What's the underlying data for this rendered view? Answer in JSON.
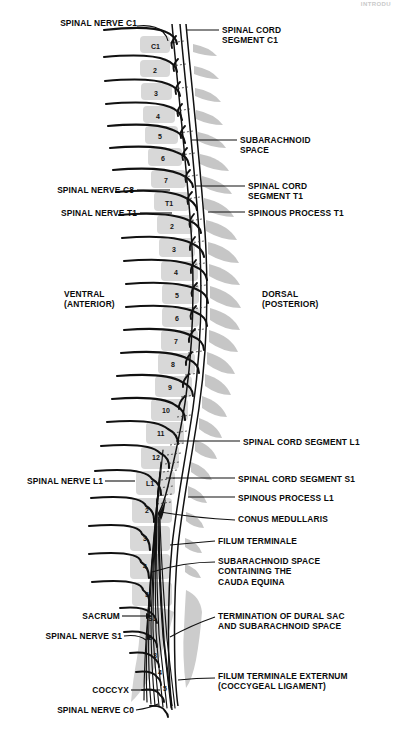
{
  "figure": {
    "title_corner": "INTRODU",
    "orientation": {
      "ventral": "VENTRAL\n(ANTERIOR)",
      "dorsal": "DORSAL\n(POSTERIOR)"
    },
    "colors": {
      "vertebra_fill": "#d6d6d6",
      "spinous_fill": "#c4c4c4",
      "outline": "#111111",
      "text": "#0a0a0a",
      "background": "#ffffff"
    },
    "labels_left": [
      {
        "name": "spinal-nerve-c1",
        "text": "SPINAL NERVE C1",
        "x": 42,
        "y": 22
      },
      {
        "name": "spinal-nerve-c8",
        "text": "SPINAL NERVE C8",
        "x": 55,
        "y": 185
      },
      {
        "name": "spinal-nerve-t1",
        "text": "SPINAL NERVE T1",
        "x": 57,
        "y": 208
      },
      {
        "name": "ventral-anterior",
        "text": "VENTRAL\n(ANTERIOR)",
        "x": 70,
        "y": 290
      },
      {
        "name": "spinal-nerve-l1",
        "text": "SPINAL NERVE L1",
        "x": 17,
        "y": 476
      },
      {
        "name": "sacrum",
        "text": "SACRUM",
        "x": 86,
        "y": 612
      },
      {
        "name": "spinal-nerve-s1",
        "text": "SPINAL NERVE S1",
        "x": 58,
        "y": 632
      },
      {
        "name": "coccyx",
        "text": "COCCYX",
        "x": 92,
        "y": 686
      },
      {
        "name": "spinal-nerve-c0",
        "text": "SPINAL NERVE C0",
        "x": 66,
        "y": 706
      }
    ],
    "labels_right": [
      {
        "name": "spinal-cord-segment-c1",
        "text": "SPINAL CORD\nSEGMENT C1",
        "x": 222,
        "y": 25
      },
      {
        "name": "subarachnoid-space",
        "text": "SUBARACHNOID\nSPACE",
        "x": 240,
        "y": 136
      },
      {
        "name": "spinal-cord-segment-t1",
        "text": "SPINAL CORD\nSEGMENT T1",
        "x": 248,
        "y": 178
      },
      {
        "name": "spinous-process-t1",
        "text": "SPINOUS PROCESS T1",
        "x": 248,
        "y": 208
      },
      {
        "name": "spinal-cord-segment-l1",
        "text": "SPINAL CORD SEGMENT L1",
        "x": 243,
        "y": 437
      },
      {
        "name": "spinal-cord-segment-s1",
        "text": "SPINAL CORD SEGMENT S1",
        "x": 238,
        "y": 474
      },
      {
        "name": "spinous-process-l1",
        "text": "SPINOUS PROCESS L1",
        "x": 238,
        "y": 495
      },
      {
        "name": "conus-medullaris",
        "text": "CONUS MEDULLARIS",
        "x": 238,
        "y": 516
      },
      {
        "name": "filum-terminale",
        "text": "FILUM TERMINALE",
        "x": 218,
        "y": 537
      },
      {
        "name": "subarachnoid-space-cauda-equina",
        "text": "SUBARACHNOID SPACE\nCONTAINING THE\nCAUDA EQUINA",
        "x": 218,
        "y": 558
      },
      {
        "name": "termination-of-dural-sac",
        "text": "TERMINATION OF DURAL SAC\nAND SUBARACHNOID SPACE",
        "x": 218,
        "y": 612
      },
      {
        "name": "filum-terminale-externum",
        "text": "FILUM TERMINALE EXTERNUM\n(COCCYGEAL LIGAMENT)",
        "x": 218,
        "y": 672
      }
    ],
    "vertebrae": [
      {
        "label": "C1",
        "y": 44,
        "x": 148,
        "w": 28,
        "h": 17,
        "skew": 1
      },
      {
        "label": "2",
        "y": 68,
        "x": 147,
        "w": 28,
        "h": 17,
        "skew": 1
      },
      {
        "label": "3",
        "y": 92,
        "x": 147,
        "w": 29,
        "h": 17,
        "skew": 1
      },
      {
        "label": "4",
        "y": 116,
        "x": 148,
        "w": 30,
        "h": 17,
        "skew": 2
      },
      {
        "label": "5",
        "y": 128,
        "x": 150,
        "w": 31,
        "h": 18,
        "skew": 2
      },
      {
        "label": "6",
        "y": 152,
        "x": 152,
        "w": 32,
        "h": 18,
        "skew": 3
      },
      {
        "label": "7",
        "y": 176,
        "x": 155,
        "w": 32,
        "h": 18,
        "skew": 3
      },
      {
        "label": "T1",
        "y": 199,
        "x": 158,
        "w": 32,
        "h": 18,
        "skew": 3
      },
      {
        "label": "2",
        "y": 222,
        "x": 160,
        "w": 33,
        "h": 19,
        "skew": 3
      },
      {
        "label": "3",
        "y": 246,
        "x": 161,
        "w": 34,
        "h": 19,
        "skew": 3
      },
      {
        "label": "4",
        "y": 270,
        "x": 162,
        "w": 34,
        "h": 19,
        "skew": 3
      },
      {
        "label": "5",
        "y": 294,
        "x": 162,
        "w": 35,
        "h": 20,
        "skew": 2
      },
      {
        "label": "6",
        "y": 318,
        "x": 161,
        "w": 35,
        "h": 20,
        "skew": 2
      },
      {
        "label": "7",
        "y": 342,
        "x": 159,
        "w": 36,
        "h": 21,
        "skew": 1
      },
      {
        "label": "8",
        "y": 366,
        "x": 156,
        "w": 36,
        "h": 21,
        "skew": 0
      },
      {
        "label": "9",
        "y": 389,
        "x": 152,
        "w": 37,
        "h": 21,
        "skew": -1
      },
      {
        "label": "10",
        "y": 412,
        "x": 148,
        "w": 38,
        "h": 22,
        "skew": -2
      },
      {
        "label": "11",
        "y": 436,
        "x": 143,
        "w": 39,
        "h": 22,
        "skew": -3
      },
      {
        "label": "12",
        "y": 460,
        "x": 138,
        "w": 40,
        "h": 23,
        "skew": -4
      },
      {
        "label": "L1",
        "y": 484,
        "x": 133,
        "w": 41,
        "h": 24,
        "skew": -4
      },
      {
        "label": "2",
        "y": 510,
        "x": 130,
        "w": 42,
        "h": 25,
        "skew": -4
      },
      {
        "label": "3",
        "y": 537,
        "x": 128,
        "w": 42,
        "h": 25,
        "skew": -3
      },
      {
        "label": "4",
        "y": 564,
        "x": 128,
        "w": 42,
        "h": 25,
        "skew": -2
      },
      {
        "label": "5",
        "y": 591,
        "x": 130,
        "w": 42,
        "h": 25,
        "skew": 0
      }
    ],
    "sacral_segments": [
      {
        "label": "S1",
        "y": 618
      },
      {
        "label": "2",
        "y": 637
      },
      {
        "label": "3",
        "y": 655
      },
      {
        "label": "4",
        "y": 671
      },
      {
        "label": "5",
        "y": 687
      }
    ]
  }
}
